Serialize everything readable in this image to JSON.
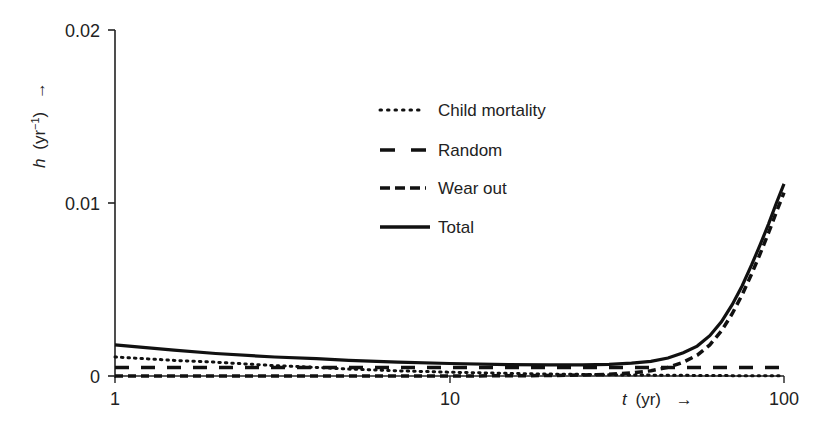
{
  "chart_data": {
    "type": "line",
    "title": "",
    "xlabel": "t (yr)",
    "ylabel": "h (yr^-1)",
    "xscale": "log",
    "xlim": [
      1,
      100
    ],
    "ylim": [
      0,
      0.02
    ],
    "xticks": [
      "1",
      "10",
      "100"
    ],
    "yticks": [
      "0",
      "0.01",
      "0.02"
    ],
    "grid": false,
    "legend_position": "upper-center",
    "x": [
      1,
      1.5,
      2,
      3,
      4,
      5,
      7,
      10,
      15,
      20,
      25,
      30,
      35,
      40,
      45,
      50,
      55,
      60,
      65,
      70,
      75,
      80,
      85,
      90,
      95,
      100
    ],
    "series": [
      {
        "name": "Child mortality",
        "style": "dotted",
        "values": [
          0.0011,
          0.0009,
          0.0008,
          0.0006,
          0.0005,
          0.0004,
          0.0003,
          0.00022,
          0.00015,
          0.00011,
          9e-05,
          7e-05,
          6e-05,
          5e-05,
          4e-05,
          4e-05,
          3e-05,
          3e-05,
          3e-05,
          2e-05,
          2e-05,
          2e-05,
          2e-05,
          1e-05,
          1e-05,
          1e-05
        ]
      },
      {
        "name": "Random",
        "style": "long-dash",
        "values": [
          0.0005,
          0.0005,
          0.0005,
          0.0005,
          0.0005,
          0.0005,
          0.0005,
          0.0005,
          0.0005,
          0.0005,
          0.0005,
          0.0005,
          0.0005,
          0.0005,
          0.0005,
          0.0005,
          0.0005,
          0.0005,
          0.0005,
          0.0005,
          0.0005,
          0.0005,
          0.0005,
          0.0005,
          0.0005,
          0.0005
        ]
      },
      {
        "name": "Wear out",
        "style": "short-dash",
        "values": [
          0.0,
          0.0,
          0.0,
          0.0,
          0.0,
          0.0,
          0.0,
          0.0,
          1e-05,
          3e-05,
          6e-05,
          0.0001,
          0.00018,
          0.0003,
          0.0005,
          0.0008,
          0.0012,
          0.0018,
          0.0026,
          0.0036,
          0.0047,
          0.0059,
          0.0071,
          0.0083,
          0.0095,
          0.0106
        ]
      },
      {
        "name": "Total",
        "style": "solid",
        "values": [
          0.0018,
          0.0015,
          0.0013,
          0.0011,
          0.001,
          0.0009,
          0.0008,
          0.00072,
          0.00066,
          0.00064,
          0.00065,
          0.00067,
          0.00074,
          0.00085,
          0.00104,
          0.00134,
          0.00173,
          0.00233,
          0.00313,
          0.00412,
          0.00522,
          0.00642,
          0.00762,
          0.00881,
          0.01001,
          0.01111
        ]
      }
    ]
  },
  "legend": {
    "items": [
      {
        "label": "Child mortality"
      },
      {
        "label": "Random"
      },
      {
        "label": "Wear out"
      },
      {
        "label": "Total"
      }
    ]
  },
  "axes": {
    "y_label_main": "h",
    "y_label_unit": "(yr",
    "y_label_exp": "−1",
    "y_label_close": ")",
    "y_arrow": "→",
    "x_label_main": "t",
    "x_label_unit": "(yr)",
    "x_arrow": "→",
    "x_tick_1": "1",
    "x_tick_10": "10",
    "x_tick_100": "100",
    "y_tick_0": "0",
    "y_tick_001": "0.01",
    "y_tick_002": "0.02"
  }
}
